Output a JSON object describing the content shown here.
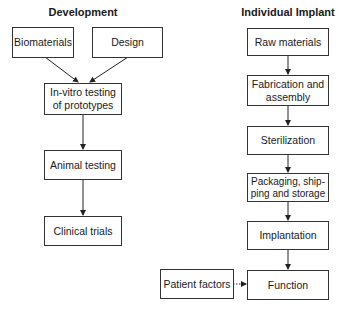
{
  "columns": {
    "development": {
      "title": "Development",
      "nodes": {
        "biomaterials": "Biomaterials",
        "design": "Design",
        "in_vitro": "In-vitro testing of prototypes",
        "animal_testing": "Animal testing",
        "clinical_trials": "Clinical trials"
      }
    },
    "individual_implant": {
      "title": "Individual Implant",
      "nodes": {
        "raw_materials": "Raw materials",
        "fabrication": "Fabrication and assembly",
        "sterilization": "Sterilization",
        "packaging": "Packaging, ship-ping and storage",
        "implantation": "Implantation",
        "function": "Function",
        "patient_factors": "Patient factors"
      }
    }
  },
  "edges": [
    {
      "from": "Biomaterials",
      "to": "In-vitro testing of prototypes",
      "style": "solid"
    },
    {
      "from": "Design",
      "to": "In-vitro testing of prototypes",
      "style": "solid"
    },
    {
      "from": "In-vitro testing of prototypes",
      "to": "Animal testing",
      "style": "solid"
    },
    {
      "from": "Animal testing",
      "to": "Clinical trials",
      "style": "solid"
    },
    {
      "from": "Raw materials",
      "to": "Fabrication and assembly",
      "style": "solid"
    },
    {
      "from": "Fabrication and assembly",
      "to": "Sterilization",
      "style": "solid"
    },
    {
      "from": "Sterilization",
      "to": "Packaging, shipping and storage",
      "style": "solid"
    },
    {
      "from": "Packaging, shipping and storage",
      "to": "Implantation",
      "style": "solid"
    },
    {
      "from": "Implantation",
      "to": "Function",
      "style": "solid"
    },
    {
      "from": "Patient factors",
      "to": "Function",
      "style": "dotted"
    }
  ],
  "colors": {
    "line": "#222222",
    "border": "#333333",
    "background": "#ffffff"
  }
}
